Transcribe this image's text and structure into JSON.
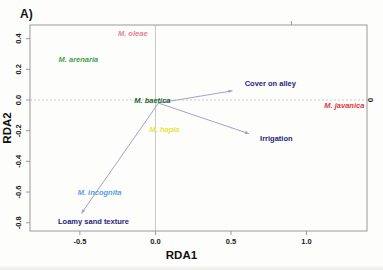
{
  "figure": {
    "panel_label": "A)"
  },
  "chart_data": {
    "type": "scatter",
    "subtype": "rda-triplot-biplot",
    "title": "",
    "xlabel": "RDA1",
    "ylabel": "RDA2",
    "xlim": [
      -0.83,
      1.4
    ],
    "ylim": [
      -0.854,
      0.489
    ],
    "grid": "zero-lines-only",
    "x_ticks": [
      {
        "value": -0.5,
        "label": "-0.5"
      },
      {
        "value": 0.0,
        "label": "0.0"
      },
      {
        "value": 0.5,
        "label": "0.5"
      },
      {
        "value": 1.0,
        "label": "1.0"
      }
    ],
    "y_ticks": [
      {
        "value": 0.4,
        "label": "0.4"
      },
      {
        "value": 0.2,
        "label": "0.2"
      },
      {
        "value": 0.0,
        "label": "0.0"
      },
      {
        "value": -0.2,
        "label": "-0.2"
      },
      {
        "value": -0.4,
        "label": "-0.4"
      },
      {
        "value": -0.6,
        "label": "-0.6"
      },
      {
        "value": -0.8,
        "label": "-0.8"
      }
    ],
    "species": [
      {
        "label": "M. oleae",
        "x": -0.15,
        "y": 0.44,
        "color": "#e87f9d"
      },
      {
        "label": "M. arenaria",
        "x": -0.51,
        "y": 0.27,
        "color": "#3fa24d"
      },
      {
        "label": "M. baetica",
        "x": -0.02,
        "y": 0.0,
        "color": "#1e642e"
      },
      {
        "label": "M. hapla",
        "x": 0.06,
        "y": -0.19,
        "color": "#ece43f"
      },
      {
        "label": "M. javanica",
        "x": 1.25,
        "y": -0.03,
        "color": "#e03a3a"
      },
      {
        "label": "M. incognita",
        "x": -0.37,
        "y": -0.6,
        "color": "#57a0e8"
      }
    ],
    "arrow_origin": {
      "x": 0.02,
      "y": -0.02
    },
    "env_vectors": [
      {
        "label": "Cover on alley",
        "x": 0.51,
        "y": 0.06,
        "label_x": 0.76,
        "label_y": 0.11
      },
      {
        "label": "Irrigation",
        "x": 0.62,
        "y": -0.22,
        "label_x": 0.8,
        "label_y": -0.25
      },
      {
        "label": "Loamy sand texture",
        "x": -0.49,
        "y": -0.74,
        "label_x": -0.41,
        "label_y": -0.79
      }
    ],
    "secondary": {
      "top_tick_x": 0.9,
      "right_label": "0",
      "right_label_y": 0.0
    },
    "colors": {
      "frame": "#9a9a9a",
      "grid": "#c9c9c9",
      "arrow": "#a3a3c8",
      "env_label": "#24247c",
      "tick_text": "#1a1a1a",
      "axis_title": "#111111"
    }
  }
}
